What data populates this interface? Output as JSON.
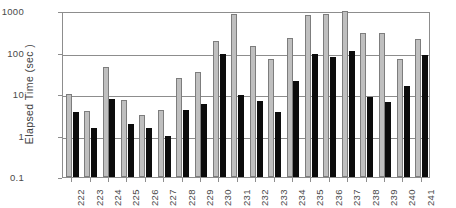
{
  "chart_data": {
    "type": "bar",
    "title": "",
    "xlabel": "",
    "ylabel": "Elapsed Time (sec )",
    "yscale": "log",
    "ylim": [
      0.1,
      1000
    ],
    "ytick_labels": [
      "1000",
      "100",
      "10",
      "1",
      "0.1"
    ],
    "ytick_values": [
      1000,
      100,
      10,
      1,
      0.1
    ],
    "grid": true,
    "legend": "none",
    "categories": [
      "222",
      "223",
      "224",
      "225",
      "226",
      "227",
      "228",
      "229",
      "230",
      "231",
      "232",
      "233",
      "234",
      "235",
      "236",
      "237",
      "238",
      "239",
      "240",
      "241"
    ],
    "series": [
      {
        "name": "series-a",
        "color": "#bfbfbf",
        "values": [
          9.8,
          3.8,
          45,
          7.0,
          3.2,
          4.2,
          24,
          34,
          190,
          870,
          140,
          68,
          225,
          820,
          830,
          1080,
          300,
          300,
          70,
          210
        ]
      },
      {
        "name": "series-b",
        "color": "#0c0c0c",
        "values": [
          3.7,
          1.5,
          7.6,
          1.9,
          1.55,
          0.95,
          4.2,
          5.9,
          92,
          9.4,
          6.7,
          3.7,
          21,
          92,
          80,
          108,
          8.6,
          6.6,
          16,
          86
        ]
      }
    ]
  }
}
